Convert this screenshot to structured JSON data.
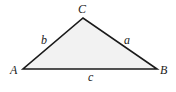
{
  "diagram": {
    "type": "triangle",
    "fill_color": "#f2f2f2",
    "stroke_color": "#1a1a1a",
    "vertices": [
      {
        "name": "A",
        "label": "A",
        "x": 23,
        "y": 69
      },
      {
        "name": "B",
        "label": "B",
        "x": 157,
        "y": 69
      },
      {
        "name": "C",
        "label": "C",
        "x": 83,
        "y": 18
      }
    ],
    "sides": [
      {
        "name": "a",
        "label": "a",
        "from": "C",
        "to": "B"
      },
      {
        "name": "b",
        "label": "b",
        "from": "A",
        "to": "C"
      },
      {
        "name": "c",
        "label": "c",
        "from": "A",
        "to": "B"
      }
    ]
  }
}
